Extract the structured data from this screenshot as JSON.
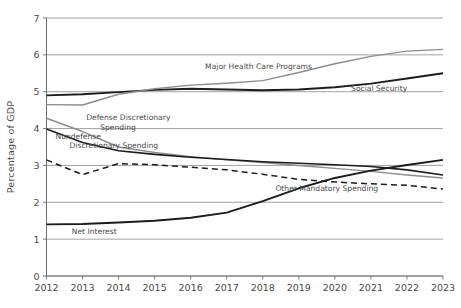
{
  "chart_data": {
    "type": "line",
    "title": "",
    "xlabel": "",
    "ylabel": "Percentage of GDP",
    "x": [
      2012,
      2013,
      2014,
      2015,
      2016,
      2017,
      2018,
      2019,
      2020,
      2021,
      2022,
      2023
    ],
    "xtick_labels": [
      "2012",
      "2013",
      "2014",
      "2015",
      "2016",
      "2017",
      "2018",
      "2019",
      "2020",
      "2021",
      "2022",
      "2023"
    ],
    "ytick_labels": [
      "0",
      "1",
      "2",
      "3",
      "4",
      "5",
      "6",
      "7"
    ],
    "yticks": [
      0,
      1,
      2,
      3,
      4,
      5,
      6,
      7
    ],
    "ylim": [
      0,
      7
    ],
    "xlim": [
      2012,
      2023
    ],
    "grid": true,
    "legend_position": "inline-annotations",
    "series": [
      {
        "name": "Social Security",
        "label": "Social Security",
        "color": "#1c1c1c",
        "style": "solid",
        "width": 1.9,
        "values": [
          4.9,
          4.93,
          4.99,
          5.05,
          5.08,
          5.06,
          5.04,
          5.06,
          5.12,
          5.22,
          5.36,
          5.5
        ],
        "label_x": 2020.45,
        "label_y": 5.02
      },
      {
        "name": "Major Health Care Programs",
        "label": "Major Health Care Programs",
        "color": "#8c8c8c",
        "style": "solid",
        "width": 1.4,
        "values": [
          4.65,
          4.64,
          4.93,
          5.08,
          5.18,
          5.23,
          5.3,
          5.52,
          5.76,
          5.96,
          6.1,
          6.15
        ],
        "label_x": 2016.4,
        "label_y": 5.62
      },
      {
        "name": "Defense Discretionary Spending",
        "label": "Defense Discretionary\nSpending",
        "color": "#8c8c8c",
        "style": "solid",
        "width": 1.4,
        "values": [
          4.28,
          3.92,
          3.5,
          3.35,
          3.24,
          3.15,
          3.08,
          3.0,
          2.92,
          2.84,
          2.74,
          2.66
        ],
        "label_x": 2013.1,
        "label_y": 4.22
      },
      {
        "name": "Nondefense Discretionary Spending",
        "label": "Nondefense\nDiscretionary Spending",
        "color": "#1c1c1c",
        "style": "solid",
        "width": 1.6,
        "values": [
          3.99,
          3.62,
          3.4,
          3.3,
          3.22,
          3.16,
          3.1,
          3.06,
          3.02,
          2.97,
          2.88,
          2.74
        ],
        "label_x": 2012.25,
        "label_y": 3.72
      },
      {
        "name": "Other Mandatory Spending",
        "label": "Other Mandatory Spending",
        "color": "#1c1c1c",
        "style": "dashed",
        "width": 1.5,
        "values": [
          3.15,
          2.75,
          3.05,
          3.02,
          2.95,
          2.88,
          2.76,
          2.62,
          2.55,
          2.5,
          2.46,
          2.36
        ],
        "label_x": 2018.35,
        "label_y": 2.3
      },
      {
        "name": "Net Interest",
        "label": "Net Interest",
        "color": "#1c1c1c",
        "style": "solid",
        "width": 1.9,
        "values": [
          1.4,
          1.41,
          1.45,
          1.5,
          1.58,
          1.72,
          2.03,
          2.38,
          2.66,
          2.86,
          3.01,
          3.15
        ],
        "label_x": 2012.7,
        "label_y": 1.15
      }
    ]
  }
}
